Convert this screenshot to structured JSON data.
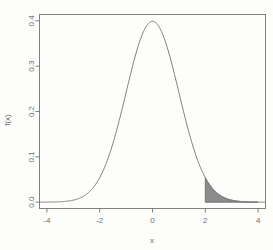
{
  "chart_data": {
    "type": "line",
    "title": "",
    "subtitle": "",
    "xlabel": "x",
    "ylabel": "f(x)",
    "xlim": [
      -4,
      4
    ],
    "ylim": [
      0.0,
      0.4
    ],
    "grid": false,
    "legend": null,
    "x_ticks": [
      "-4",
      "-2",
      "0",
      "2",
      "4"
    ],
    "x_tick_values": [
      -4,
      -2,
      0,
      2,
      4
    ],
    "y_ticks": [
      "0.0",
      "0.1",
      "0.2",
      "0.3",
      "0.4"
    ],
    "y_tick_values": [
      0.0,
      0.1,
      0.2,
      0.3,
      0.4
    ],
    "series": [
      {
        "name": "standard normal density",
        "distribution": "normal",
        "mean": 0,
        "sd": 1,
        "x": [
          -4.0,
          -3.8,
          -3.6,
          -3.4,
          -3.2,
          -3.0,
          -2.8,
          -2.6,
          -2.4,
          -2.2,
          -2.0,
          -1.8,
          -1.6,
          -1.4,
          -1.2,
          -1.0,
          -0.8,
          -0.6,
          -0.4,
          -0.2,
          0.0,
          0.2,
          0.4,
          0.6,
          0.8,
          1.0,
          1.2,
          1.4,
          1.6,
          1.8,
          2.0,
          2.2,
          2.4,
          2.6,
          2.8,
          3.0,
          3.2,
          3.4,
          3.6,
          3.8,
          4.0
        ],
        "values": [
          0.0001,
          0.0003,
          0.0006,
          0.0012,
          0.0024,
          0.0044,
          0.0079,
          0.0136,
          0.0224,
          0.0355,
          0.054,
          0.079,
          0.1109,
          0.1497,
          0.1942,
          0.242,
          0.2897,
          0.3332,
          0.3683,
          0.391,
          0.3989,
          0.391,
          0.3683,
          0.3332,
          0.2897,
          0.242,
          0.1942,
          0.1497,
          0.1109,
          0.079,
          0.054,
          0.0355,
          0.0224,
          0.0136,
          0.0079,
          0.0044,
          0.0024,
          0.0012,
          0.0006,
          0.0003,
          0.0001
        ],
        "color": "#7f7f7f"
      }
    ],
    "shaded_region": {
      "name": "right-tail",
      "from": 2,
      "to": 4,
      "fill_color": "#8c8c8c",
      "edge_color": "#6b6b6b"
    },
    "peak": {
      "x": 0,
      "y": 0.3989
    },
    "box_color": "#7f7f7f"
  },
  "axes": {
    "x_title": "x",
    "y_title": "f(x)"
  }
}
